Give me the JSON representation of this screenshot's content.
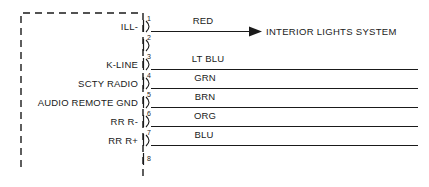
{
  "diagram": {
    "module": {
      "name": "radio-module",
      "style": "dashed-outline"
    },
    "connector": {
      "pin_count": 8,
      "pins": [
        {
          "number": "1",
          "label": "ILL-",
          "wire_color_label": "RED",
          "has_wire": true,
          "destination": "INTERIOR LIGHTS SYSTEM",
          "has_arrow": true
        },
        {
          "number": "2",
          "label": "",
          "wire_color_label": "",
          "has_wire": false,
          "destination": "",
          "has_arrow": false
        },
        {
          "number": "3",
          "label": "K-LINE",
          "wire_color_label": "LT BLU",
          "has_wire": true,
          "destination": "",
          "has_arrow": false
        },
        {
          "number": "4",
          "label": "SCTY RADIO",
          "wire_color_label": "GRN",
          "has_wire": true,
          "destination": "",
          "has_arrow": false
        },
        {
          "number": "5",
          "label": "AUDIO REMOTE GND",
          "wire_color_label": "BRN",
          "has_wire": true,
          "destination": "",
          "has_arrow": false
        },
        {
          "number": "6",
          "label": "RR R-",
          "wire_color_label": "ORG",
          "has_wire": true,
          "destination": "",
          "has_arrow": false
        },
        {
          "number": "7",
          "label": "RR R+",
          "wire_color_label": "BLU",
          "has_wire": true,
          "destination": "",
          "has_arrow": false
        },
        {
          "number": "8",
          "label": "",
          "wire_color_label": "",
          "has_wire": false,
          "destination": "",
          "has_arrow": false
        }
      ]
    },
    "colors": {
      "ink": "#1a1a1a",
      "background": "#ffffff"
    }
  }
}
